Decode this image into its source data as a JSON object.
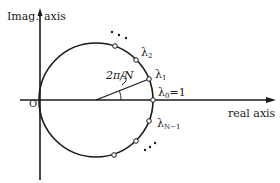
{
  "figure": {
    "type": "unit-circle-roots-of-unity",
    "labels": {
      "imag_axis_left": "Imag.",
      "imag_axis_right": "axis",
      "real_axis": "real axis",
      "origin": "O",
      "angle": "2π/N",
      "lambda0_base": "λ",
      "lambda0_sub": "0",
      "lambda0_value": "=1",
      "lambda1_base": "λ",
      "lambda1_sub": "1",
      "lambda2_base": "λ",
      "lambda2_sub": "2",
      "lambdaN1_base": "λ",
      "lambdaN1_sub": "N−1"
    },
    "ellipsis_upper": "• • •",
    "ellipsis_lower": "• • •",
    "colors": {
      "ink": "#1a1a1a",
      "background": "#ffffff"
    }
  }
}
